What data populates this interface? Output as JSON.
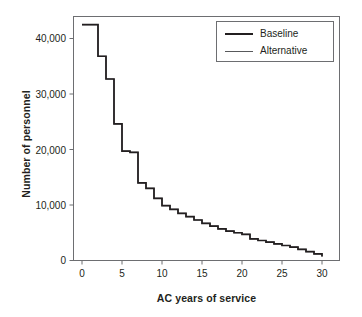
{
  "figure": {
    "background": "#ffffff",
    "frame_color": "#6d6e71",
    "line_color": "#231f20",
    "alt_line_color": "#58595b"
  },
  "legend": {
    "position": "top-right",
    "entries": [
      {
        "label": "Baseline",
        "style": "thick",
        "color": "#231f20"
      },
      {
        "label": "Alternative",
        "style": "thin",
        "color": "#58595b"
      }
    ]
  },
  "axes": {
    "y_title": "Number of personnel",
    "x_title": "AC years of service",
    "y_ticks": [
      "0",
      "10,000",
      "20,000",
      "30,000",
      "40,000"
    ],
    "x_ticks": [
      "0",
      "5",
      "10",
      "15",
      "20",
      "25",
      "30"
    ]
  },
  "chart_data": {
    "type": "line",
    "title": "",
    "subtitle": "",
    "xlabel": "AC years of service",
    "ylabel": "Number of personnel",
    "xlim": [
      0,
      30
    ],
    "ylim": [
      0,
      45000
    ],
    "xticks": [
      0,
      5,
      10,
      15,
      20,
      25,
      30
    ],
    "yticks": [
      0,
      10000,
      20000,
      30000,
      40000
    ],
    "grid": false,
    "drawstyle": "steps-post",
    "legend_position": "upper right",
    "x": [
      0,
      1,
      2,
      3,
      4,
      5,
      6,
      7,
      8,
      9,
      10,
      11,
      12,
      13,
      14,
      15,
      16,
      17,
      18,
      19,
      20,
      21,
      22,
      23,
      24,
      25,
      26,
      27,
      28,
      29,
      30
    ],
    "series": [
      {
        "name": "Baseline",
        "color": "#231f20",
        "values": [
          42500,
          42500,
          36800,
          32700,
          24600,
          19700,
          19500,
          14000,
          13000,
          11200,
          9900,
          9200,
          8500,
          7900,
          7300,
          6700,
          6200,
          5700,
          5300,
          5000,
          4700,
          3900,
          3600,
          3300,
          3000,
          2700,
          2400,
          2000,
          1600,
          1200,
          700
        ]
      },
      {
        "name": "Alternative",
        "color": "#58595b",
        "values": [
          42500,
          42500,
          36800,
          32700,
          24600,
          19700,
          19500,
          14000,
          13000,
          11200,
          9900,
          9200,
          8500,
          7900,
          7300,
          6700,
          6200,
          5700,
          5300,
          5000,
          4700,
          3900,
          3600,
          3300,
          3000,
          2700,
          2400,
          2000,
          1600,
          1200,
          700
        ]
      }
    ]
  }
}
